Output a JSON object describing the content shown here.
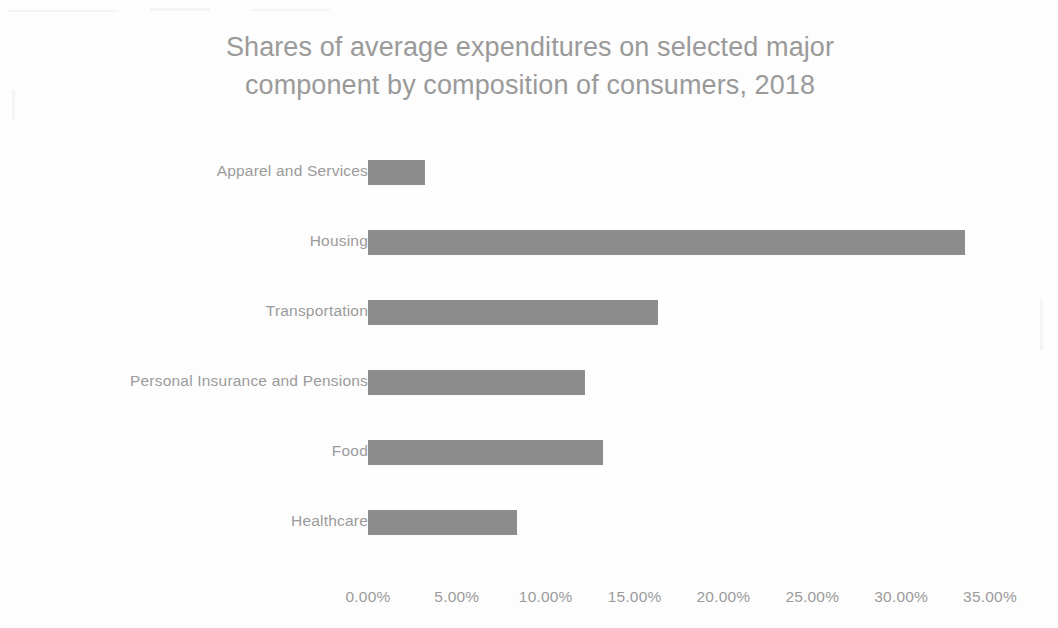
{
  "chart_data": {
    "type": "bar",
    "orientation": "horizontal",
    "title": "Shares of average expenditures on selected major component by composition of consumers, 2018",
    "title_lines": [
      "Shares of average expenditures on selected major",
      "component by composition of consumers, 2018"
    ],
    "xlabel": "",
    "ylabel": "",
    "categories": [
      "Apparel and Services",
      "Housing",
      "Transportation",
      "Personal Insurance and Pensions",
      "Food",
      "Healthcare"
    ],
    "values": [
      3.2,
      33.6,
      16.3,
      12.2,
      13.2,
      8.4
    ],
    "value_labels": [
      "3.20%",
      "33.60%",
      "16.30%",
      "12.20%",
      "13.20%",
      "8.40%"
    ],
    "xlim": [
      0,
      35
    ],
    "xtick_values": [
      0,
      5,
      10,
      15,
      20,
      25,
      30,
      35
    ],
    "xtick_labels": [
      "0.00%",
      "5.00%",
      "10.00%",
      "15.00%",
      "20.00%",
      "25.00%",
      "30.00%",
      "35.00%"
    ],
    "grid": false,
    "legend": false,
    "bar_color": "#8d8d8d",
    "text_color": "#9b9b9b",
    "title_color": "#9a9a9a",
    "background_color": "#fdfdfd"
  }
}
